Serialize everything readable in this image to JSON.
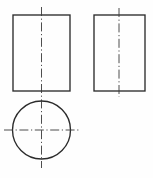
{
  "drawing": {
    "title": "Orthographic projection: two rectangular views and one circular view",
    "type": "engineering-line-drawing",
    "canvas": {
      "width": 153,
      "height": 178,
      "background": "#fefefe"
    },
    "style": {
      "outline_color": "#2b2b2b",
      "outline_width": 1.35,
      "centerline_color": "#3a3a3a",
      "centerline_width": 0.9,
      "centerline_dash_pattern": "9 2.6 1.2 2.6"
    },
    "views": [
      {
        "id": "front-view",
        "label": "Front view rectangle",
        "shape": "rectangle",
        "x": 13,
        "y": 15,
        "width": 57,
        "height": 76
      },
      {
        "id": "side-view",
        "label": "Side view rectangle",
        "shape": "rectangle",
        "x": 94,
        "y": 15,
        "width": 51,
        "height": 76
      },
      {
        "id": "top-view",
        "label": "Top view circle",
        "shape": "circle",
        "cx": 41.5,
        "cy": 130,
        "r": 29
      }
    ],
    "centerlines": [
      {
        "id": "front-view-vertical-centerline",
        "orientation": "vertical",
        "x": 41.5,
        "y1": 7,
        "y2": 168
      },
      {
        "id": "side-view-vertical-centerline",
        "orientation": "vertical",
        "x": 119,
        "y1": 8,
        "y2": 97
      },
      {
        "id": "top-view-horizontal-centerline",
        "orientation": "horizontal",
        "y": 130,
        "x1": 4,
        "x2": 79
      }
    ]
  }
}
